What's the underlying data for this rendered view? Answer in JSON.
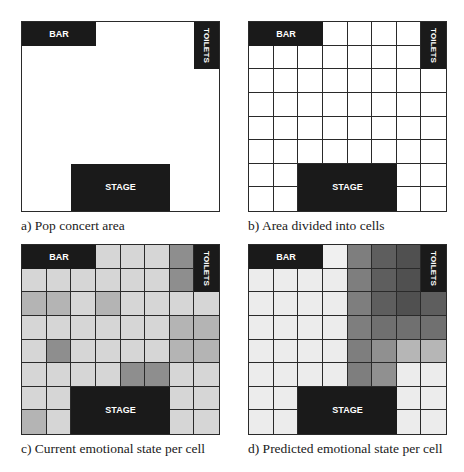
{
  "figure": {
    "panels": [
      {
        "id": "a",
        "caption": "a) Pop concert area",
        "show_grid": false
      },
      {
        "id": "b",
        "caption": "b) Area divided into cells",
        "show_grid": true
      },
      {
        "id": "c",
        "caption": "c) Current emotional state per cell",
        "show_grid": true,
        "shades": [
          [
            "X",
            "X",
            "X",
            "#d6d6d6",
            "#d6d6d6",
            "#d6d6d6",
            "#8e8e8e",
            "X"
          ],
          [
            "#d6d6d6",
            "#d6d6d6",
            "#d6d6d6",
            "#d6d6d6",
            "#d6d6d6",
            "#d6d6d6",
            "#8e8e8e",
            "X"
          ],
          [
            "#b4b4b4",
            "#b4b4b4",
            "#d6d6d6",
            "#b4b4b4",
            "#d6d6d6",
            "#d6d6d6",
            "#d6d6d6",
            "#d6d6d6"
          ],
          [
            "#d6d6d6",
            "#d6d6d6",
            "#d6d6d6",
            "#d6d6d6",
            "#d6d6d6",
            "#d6d6d6",
            "#b4b4b4",
            "#b4b4b4"
          ],
          [
            "#d6d6d6",
            "#8e8e8e",
            "#d6d6d6",
            "#d6d6d6",
            "#d6d6d6",
            "#d6d6d6",
            "#b4b4b4",
            "#b4b4b4"
          ],
          [
            "#d6d6d6",
            "#d6d6d6",
            "#d6d6d6",
            "#d6d6d6",
            "#8e8e8e",
            "#8e8e8e",
            "#d6d6d6",
            "#d6d6d6"
          ],
          [
            "#d6d6d6",
            "#d6d6d6",
            "X",
            "X",
            "X",
            "X",
            "#d6d6d6",
            "#d6d6d6"
          ],
          [
            "#b4b4b4",
            "#d6d6d6",
            "X",
            "X",
            "X",
            "X",
            "#d6d6d6",
            "#d6d6d6"
          ]
        ]
      },
      {
        "id": "d",
        "caption": "d) Predicted emotional state per cell",
        "show_grid": true,
        "shades": [
          [
            "X",
            "X",
            "X",
            "#f0f0f0",
            "#7e7e7e",
            "#5e5e5e",
            "#505050",
            "X"
          ],
          [
            "#ececec",
            "#ececec",
            "#ececec",
            "#ececec",
            "#7e7e7e",
            "#5e5e5e",
            "#505050",
            "X"
          ],
          [
            "#ececec",
            "#ececec",
            "#ececec",
            "#ececec",
            "#7e7e7e",
            "#5e5e5e",
            "#505050",
            "#5e5e5e"
          ],
          [
            "#ececec",
            "#ececec",
            "#ececec",
            "#ececec",
            "#7e7e7e",
            "#707070",
            "#707070",
            "#707070"
          ],
          [
            "#ececec",
            "#ececec",
            "#ececec",
            "#ececec",
            "#7e7e7e",
            "#909090",
            "#b6b6b6",
            "#b6b6b6"
          ],
          [
            "#ececec",
            "#ececec",
            "#ececec",
            "#ececec",
            "#7e7e7e",
            "#909090",
            "#ececec",
            "#ececec"
          ],
          [
            "#ececec",
            "#ececec",
            "X",
            "X",
            "X",
            "X",
            "#ececec",
            "#ececec"
          ],
          [
            "#ececec",
            "#ececec",
            "X",
            "X",
            "X",
            "X",
            "#ececec",
            "#ececec"
          ]
        ]
      }
    ],
    "grid": {
      "rows": 8,
      "cols": 8
    },
    "features": {
      "bar": {
        "label": "BAR",
        "col": 0,
        "row": 0,
        "colspan": 3,
        "rowspan": 1
      },
      "toilets": {
        "label": "TOILETS",
        "col": 7,
        "row": 0,
        "colspan": 1,
        "rowspan": 2
      },
      "stage": {
        "label": "STAGE",
        "col": 2,
        "row": 6,
        "colspan": 4,
        "rowspan": 2
      }
    },
    "colors": {
      "feature_fill": "#1a1a1a",
      "grid_line": "#2a2a2a",
      "background": "#ffffff"
    }
  }
}
